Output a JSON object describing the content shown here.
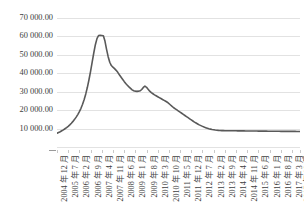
{
  "chart_data": {
    "type": "line",
    "title": "",
    "subtitle": "",
    "xlabel": "",
    "ylabel": "",
    "grid": true,
    "legend": false,
    "legend_position": "none",
    "ylim": [
      0,
      70000
    ],
    "y_ticks": [
      10000,
      20000,
      30000,
      40000,
      50000,
      60000,
      70000
    ],
    "y_tick_labels": [
      "10 000.00",
      "20 000.00",
      "30 000.00",
      "40 000.00",
      "50 000.00",
      "60 000.00",
      "70 000.00"
    ],
    "x_tick_labels": [
      "2004 年 12 月",
      "2005 年 7 月",
      "2006 年 2 月",
      "2006 年 9 月",
      "2007 年 4 月",
      "2007 年 11 月",
      "2008 年 6 月",
      "2009 年 1 月",
      "2009 年 8 月",
      "2010 年 3 月",
      "2010 年 10 月",
      "2011 年 5 月",
      "2011 年 12 月",
      "2012 年 7 月",
      "2013 年 2 月",
      "2013 年 9 月",
      "2014 年 4 月",
      "2014 年 11 月",
      "2015 年 6 月",
      "2016 年 1 月",
      "2016 年 8 月",
      "2017 年 3 月",
      "2017 年 10 月"
    ],
    "x_tick_interval_months": 7,
    "series": [
      {
        "name": "series-1",
        "color": "#595959",
        "values": [
          7500,
          7900,
          8300,
          8800,
          9300,
          9900,
          10500,
          11200,
          12000,
          12900,
          13900,
          15000,
          16200,
          17600,
          19200,
          21000,
          23200,
          25800,
          28800,
          32400,
          36500,
          41000,
          46000,
          51000,
          55500,
          58800,
          60500,
          60600,
          60500,
          60400,
          57500,
          53000,
          49000,
          46000,
          44200,
          43300,
          42500,
          41600,
          40500,
          39200,
          38000,
          36800,
          35600,
          34500,
          33500,
          32600,
          31800,
          31000,
          30500,
          30300,
          30200,
          30300,
          30500,
          31200,
          32300,
          33000,
          32400,
          31300,
          30300,
          29500,
          28900,
          28300,
          27800,
          27300,
          26800,
          26300,
          25800,
          25300,
          24800,
          24300,
          23600,
          22800,
          22000,
          21300,
          20700,
          20100,
          19500,
          18900,
          18300,
          17700,
          17100,
          16500,
          15900,
          15300,
          14700,
          14100,
          13500,
          13000,
          12500,
          12000,
          11600,
          11200,
          10800,
          10500,
          10200,
          9900,
          9700,
          9500,
          9350,
          9200,
          9100,
          9000,
          8950,
          8900,
          8870,
          8850,
          8840,
          8830,
          8820,
          8810,
          8800,
          8790,
          8780,
          8770,
          8760,
          8750,
          8740,
          8730,
          8720,
          8710,
          8700,
          8690,
          8680,
          8670,
          8660,
          8650,
          8640,
          8630,
          8620,
          8610,
          8600,
          8590,
          8580,
          8570,
          8560,
          8550,
          8540,
          8530,
          8520,
          8510,
          8500,
          8495,
          8490,
          8485,
          8480,
          8475,
          8470,
          8465,
          8460,
          8455,
          8450,
          8445,
          8440
        ]
      }
    ]
  },
  "style": {
    "line_color": "#595959",
    "grid_color": "#e2e2e2",
    "text_color": "#404040",
    "background": "#ffffff"
  }
}
